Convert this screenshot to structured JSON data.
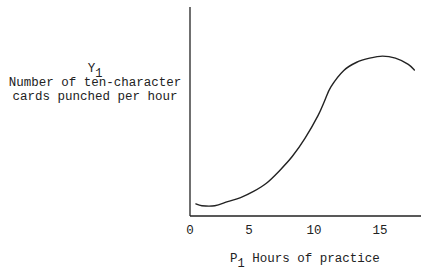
{
  "chart_data": {
    "type": "line",
    "title": "",
    "xlabel": "P1 Hours of practice",
    "ylabel": "Y1 Number of ten-character cards punched per hour",
    "x_ticks": [
      "0",
      "5",
      "10",
      "15"
    ],
    "y_ticks": [],
    "xlim": [
      0,
      18
    ],
    "ylim": [
      0,
      100
    ],
    "grid": false,
    "legend": null,
    "series": [
      {
        "name": "Learning curve",
        "x": [
          0.5,
          1,
          2,
          3,
          4,
          5,
          6,
          7,
          8,
          9,
          10,
          10.5,
          11,
          12,
          13,
          14,
          15,
          16,
          17,
          17.5
        ],
        "y": [
          6,
          5,
          5,
          7,
          9,
          12,
          16,
          22,
          29,
          38,
          49,
          56,
          63,
          71,
          75,
          77,
          78,
          77,
          74,
          71
        ]
      }
    ],
    "annotations": []
  },
  "labels": {
    "y_symbol": "Y",
    "y_symbol_sub": "1",
    "y_line1": "Number of ten-character",
    "y_line2": "cards punched per hour",
    "x_symbol": "P",
    "x_symbol_sub": "1",
    "x_text": "Hours of practice",
    "ticks": [
      "0",
      "5",
      "10",
      "15"
    ]
  }
}
